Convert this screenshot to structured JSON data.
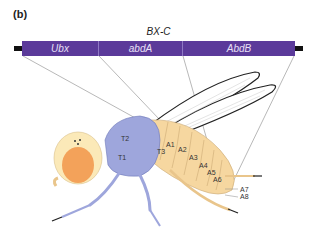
{
  "panel_label": "(b)",
  "complex": {
    "title": "BX-C",
    "genes": [
      {
        "name": "Ubx",
        "width": 77
      },
      {
        "name": "abdA",
        "width": 84
      },
      {
        "name": "AbdB",
        "width": 112
      }
    ],
    "bar_color": "#5b3a9a"
  },
  "fly": {
    "thorax_labels": [
      "T2",
      "T1",
      "T3"
    ],
    "abdomen_labels": [
      "A1",
      "A2",
      "A3",
      "A4",
      "A5",
      "A6",
      "A7",
      "A8"
    ],
    "colors": {
      "thorax": "#9ea6dc",
      "abdomen": "#f6d7a0",
      "head": "#fbe9b8",
      "eye": "#f3a25a"
    }
  }
}
